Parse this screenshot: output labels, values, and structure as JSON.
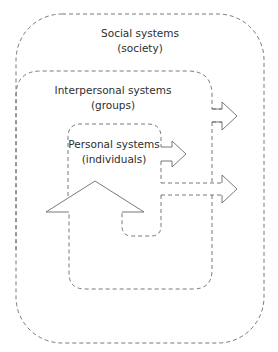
{
  "diagram": {
    "type": "nested-systems",
    "levels": [
      {
        "id": "social",
        "title": "Social systems",
        "subtitle": "(society)"
      },
      {
        "id": "interpersonal",
        "title": "Interpersonal systems",
        "subtitle": "(groups)"
      },
      {
        "id": "personal",
        "title": "Personal systems",
        "subtitle": "(individuals)"
      }
    ],
    "arrows": [
      {
        "from": "interpersonal",
        "to": "social",
        "direction": "right"
      },
      {
        "from": "personal",
        "to": "interpersonal",
        "direction": "right"
      },
      {
        "from": "personal",
        "to": "social",
        "direction": "right"
      },
      {
        "from": "interpersonal",
        "to": "personal",
        "direction": "up"
      }
    ],
    "colors": {
      "line": "#6a6a6a",
      "text": "#2e2e2e",
      "background": "#ffffff"
    }
  }
}
